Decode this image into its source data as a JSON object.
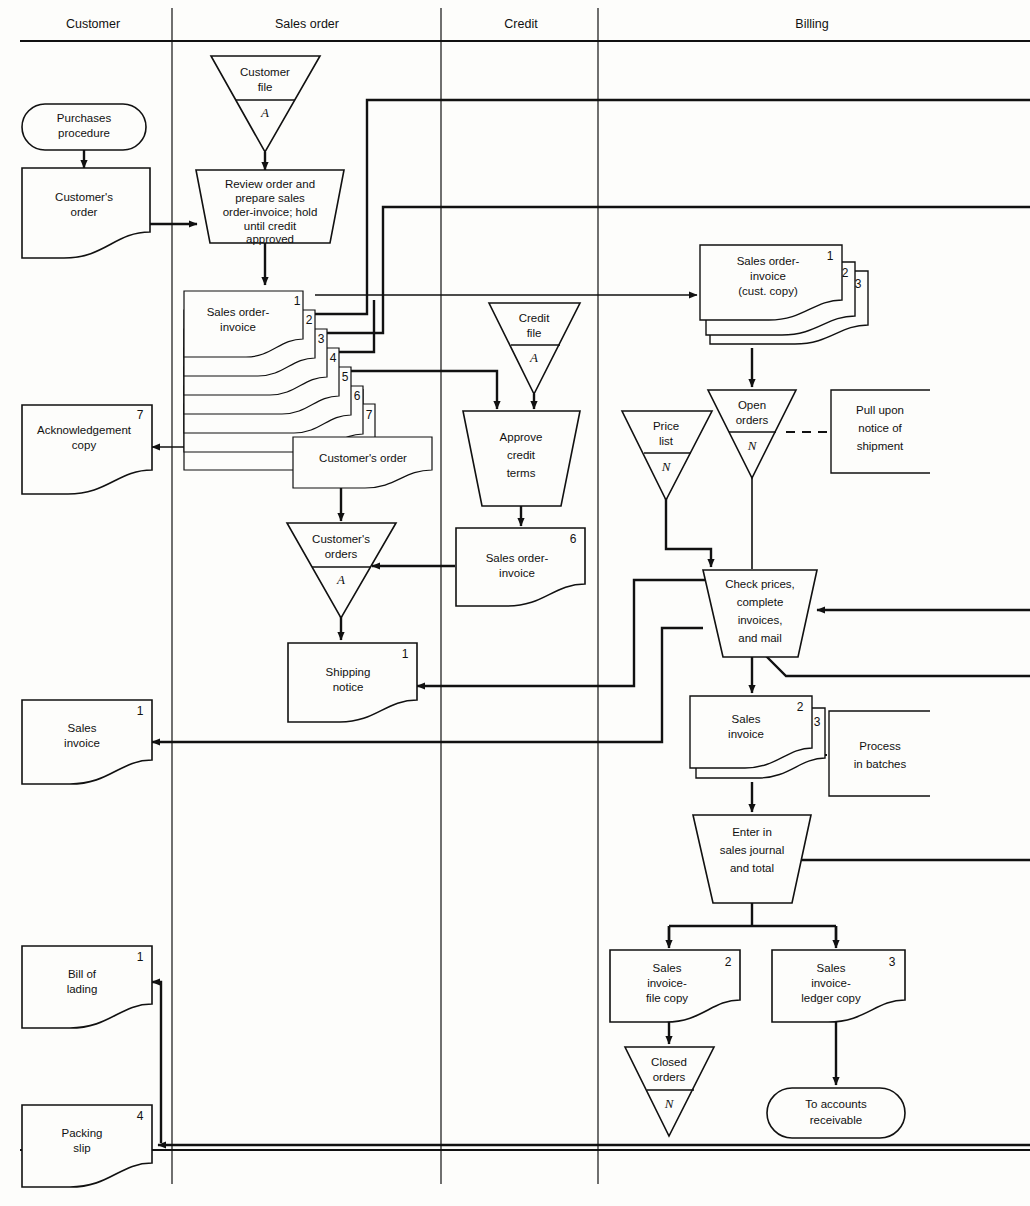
{
  "diagram": {
    "columns": [
      {
        "id": "customer",
        "label": "Customer",
        "x": 93
      },
      {
        "id": "sales-order",
        "label": "Sales order",
        "x": 307
      },
      {
        "id": "credit",
        "label": "Credit",
        "x": 521
      },
      {
        "id": "billing",
        "label": "Billing",
        "x": 812
      }
    ],
    "dividers_x": [
      172,
      441,
      598
    ],
    "header_rule_y": 41,
    "footer_rule_y": 1150,
    "stroke": "#111111",
    "background": "#fdfdfb"
  },
  "nodes": {
    "purchases_procedure": {
      "label": "Purchases\nprocedure",
      "shape": "terminator"
    },
    "customers_order_doc": {
      "label": "Customer's\norder",
      "shape": "document"
    },
    "customer_file": {
      "label": "Customer\nfile",
      "shape": "offline-store",
      "code": "A"
    },
    "review_order": {
      "label": "Review order and\nprepare sales\norder-invoice; hold\nuntil credit\napproved",
      "shape": "manual-operation"
    },
    "sales_order_invoice_stack": {
      "label": "Sales order-\ninvoice",
      "shape": "document-stack",
      "copies": [
        "1",
        "2",
        "3",
        "4",
        "5",
        "6",
        "7"
      ]
    },
    "customers_order_copy": {
      "label": "Customer's order",
      "shape": "document"
    },
    "acknowledgement_copy": {
      "label": "Acknowledgement\ncopy",
      "shape": "document",
      "copy": "7"
    },
    "customers_orders_file": {
      "label": "Customer's\norders",
      "shape": "offline-store",
      "code": "A"
    },
    "shipping_notice": {
      "label": "Shipping\nnotice",
      "shape": "document",
      "copy": "1"
    },
    "sales_invoice_cust": {
      "label": "Sales\ninvoice",
      "shape": "document",
      "copy": "1"
    },
    "bill_of_lading": {
      "label": "Bill of\nlading",
      "shape": "document",
      "copy": "1"
    },
    "packing_slip": {
      "label": "Packing\nslip",
      "shape": "document",
      "copy": "4"
    },
    "credit_file": {
      "label": "Credit\nfile",
      "shape": "offline-store",
      "code": "A"
    },
    "approve_credit": {
      "label": "Approve\ncredit\nterms",
      "shape": "manual-operation"
    },
    "sales_order_invoice_6": {
      "label": "Sales order-\ninvoice",
      "shape": "document",
      "copy": "6"
    },
    "soi_cust_copy": {
      "label": "Sales order-\ninvoice\n(cust. copy)",
      "shape": "document-stack",
      "copies": [
        "1",
        "2",
        "3"
      ]
    },
    "open_orders": {
      "label": "Open\norders",
      "shape": "offline-store",
      "code": "N"
    },
    "pull_upon_notice": {
      "label": "Pull upon\nnotice of\nshipment",
      "shape": "annotation"
    },
    "price_list": {
      "label": "Price\nlist",
      "shape": "offline-store",
      "code": "N"
    },
    "check_prices": {
      "label": "Check prices,\ncomplete\ninvoices,\nand mail",
      "shape": "manual-operation"
    },
    "sales_invoice_23": {
      "label": "Sales\ninvoice",
      "shape": "document-stack",
      "copies": [
        "2",
        "3"
      ]
    },
    "process_in_batches": {
      "label": "Process\nin batches",
      "shape": "annotation"
    },
    "enter_sales_journal": {
      "label": "Enter in\nsales journal\nand total",
      "shape": "manual-operation"
    },
    "sales_invoice_file_copy": {
      "label": "Sales\ninvoice-\nfile copy",
      "shape": "document",
      "copy": "2"
    },
    "sales_invoice_ledger_copy": {
      "label": "Sales\ninvoice-\nledger copy",
      "shape": "document",
      "copy": "3"
    },
    "closed_orders": {
      "label": "Closed\norders",
      "shape": "offline-store",
      "code": "N"
    },
    "to_accounts_receivable": {
      "label": "To accounts\nreceivable",
      "shape": "terminator"
    }
  },
  "text": {
    "customer": "Customer",
    "sales_order": "Sales order",
    "credit": "Credit",
    "billing": "Billing",
    "purchases_l1": "Purchases",
    "purchases_l2": "procedure",
    "custorder_l1": "Customer's",
    "custorder_l2": "order",
    "custfile_l1": "Customer",
    "custfile_l2": "file",
    "A": "A",
    "N": "N",
    "review_l1": "Review order and",
    "review_l2": "prepare sales",
    "review_l3": "order-invoice; hold",
    "review_l4": "until credit",
    "review_l5": "approved",
    "soi_l1": "Sales order-",
    "soi_l2": "invoice",
    "n1": "1",
    "n2": "2",
    "n3": "3",
    "n4": "4",
    "n5": "5",
    "n6": "6",
    "n7": "7",
    "customers_order": "Customer's order",
    "ack_l1": "Acknowledgement",
    "ack_l2": "copy",
    "custorders_l1": "Customer's",
    "custorders_l2": "orders",
    "ship_l1": "Shipping",
    "ship_l2": "notice",
    "salesinv_l1": "Sales",
    "salesinv_l2": "invoice",
    "bol_l1": "Bill of",
    "bol_l2": "lading",
    "pack_l1": "Packing",
    "pack_l2": "slip",
    "creditfile_l1": "Credit",
    "creditfile_l2": "file",
    "approve_l1": "Approve",
    "approve_l2": "credit",
    "approve_l3": "terms",
    "custcopy_l3": "(cust. copy)",
    "open_l1": "Open",
    "open_l2": "orders",
    "pull_l1": "Pull upon",
    "pull_l2": "notice of",
    "pull_l3": "shipment",
    "price_l1": "Price",
    "price_l2": "list",
    "check_l1": "Check prices,",
    "check_l2": "complete",
    "check_l3": "invoices,",
    "check_l4": "and mail",
    "proc_l1": "Process",
    "proc_l2": "in batches",
    "enter_l1": "Enter in",
    "enter_l2": "sales journal",
    "enter_l3": "and total",
    "sifc_l1": "Sales",
    "sifc_l2": "invoice-",
    "sifc_l3": "file copy",
    "silc_l1": "Sales",
    "silc_l2": "invoice-",
    "silc_l3": "ledger copy",
    "closed_l1": "Closed",
    "closed_l2": "orders",
    "tar_l1": "To accounts",
    "tar_l2": "receivable"
  }
}
